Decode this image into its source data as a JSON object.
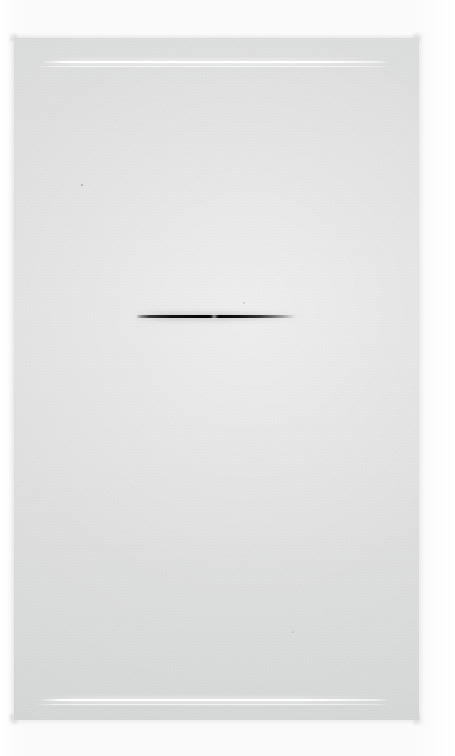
{
  "document": {
    "kind": "scanned-page",
    "description": "Blank scanned page with a single dark horizontal stroke",
    "width": 455,
    "height": 756,
    "visible_text": ""
  },
  "colors": {
    "backdrop": "#fdfdfd",
    "page": "#dcdcdc",
    "page_edge": "#d6d8d8",
    "rule_line": "#ffffff",
    "stroke": "#0a0a0a"
  },
  "page_panel": {
    "left": 14,
    "top": 38,
    "width": 405,
    "height": 682
  },
  "marks": [
    {
      "name": "rule-line-top",
      "type": "horizontal-rule",
      "color": "#ffffff",
      "left": 42,
      "top": 61,
      "width": 348,
      "height": 2
    },
    {
      "name": "rule-line-top-secondary",
      "type": "horizontal-rule",
      "color": "#ffffff",
      "left": 36,
      "top": 66,
      "width": 356,
      "height": 1
    },
    {
      "name": "center-stroke",
      "type": "tapered-stroke",
      "color": "#0a0a0a",
      "left": 138,
      "top": 315,
      "width": 154,
      "height": 3
    },
    {
      "name": "rule-line-bottom",
      "type": "horizontal-rule",
      "color": "#ffffff",
      "left": 40,
      "top": 699,
      "width": 350,
      "height": 2
    },
    {
      "name": "rule-line-bottom-secondary",
      "type": "horizontal-rule",
      "color": "#ffffff",
      "left": 34,
      "top": 704,
      "width": 358,
      "height": 1
    }
  ],
  "specks": [
    {
      "name": "speck-a",
      "left": 81,
      "top": 184
    },
    {
      "name": "speck-b",
      "left": 243,
      "top": 302
    },
    {
      "name": "speck-c",
      "left": 292,
      "top": 631
    }
  ]
}
